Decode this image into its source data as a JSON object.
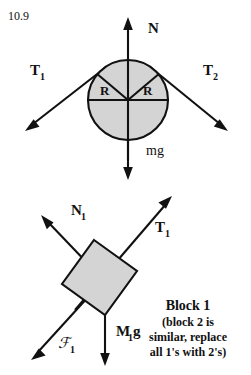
{
  "figure": {
    "problem_number": "10.9",
    "background_color": "#ffffff",
    "ink_color": "#111111",
    "body_fill_color": "#d4d4d4"
  },
  "pulley_diagram": {
    "name": "pulley-free-body-diagram",
    "center": {
      "x": 128,
      "y": 100
    },
    "radius": 40,
    "labels": {
      "normal_force": "N",
      "weight": "mg",
      "tension_left": "T",
      "tension_left_sub": "1",
      "tension_right": "T",
      "tension_right_sub": "2",
      "radius_left": "R",
      "radius_right": "R"
    },
    "forces": [
      {
        "name": "normal-force",
        "symbol": "N",
        "direction": "up"
      },
      {
        "name": "weight",
        "symbol": "mg",
        "direction": "down"
      },
      {
        "name": "tension-1",
        "symbol": "T1",
        "direction": "down-left"
      },
      {
        "name": "tension-2",
        "symbol": "T2",
        "direction": "down-right"
      }
    ]
  },
  "block_diagram": {
    "name": "block-free-body-diagram",
    "labels": {
      "normal_force": "N",
      "normal_force_sub": "1",
      "tension": "T",
      "tension_sub": "1",
      "friction": "ℱ",
      "friction_sub": "1",
      "weight": "M",
      "weight_sub": "1",
      "weight_tail": "g"
    },
    "forces": [
      {
        "name": "normal-force",
        "symbol": "N1",
        "direction": "up-left"
      },
      {
        "name": "tension",
        "symbol": "T1",
        "direction": "up-right"
      },
      {
        "name": "friction",
        "symbol": "F1",
        "direction": "down-left"
      },
      {
        "name": "weight",
        "symbol": "M1g",
        "direction": "down"
      }
    ],
    "caption": {
      "title": "Block 1",
      "line1": "(block 2 is",
      "line2": "similar, replace",
      "line3": "all 1's with 2's)"
    }
  }
}
